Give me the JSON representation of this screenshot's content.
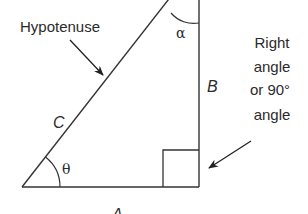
{
  "diagram": {
    "labels": {
      "hypotenuse": "Hypotenuse",
      "side_c": "C",
      "side_b": "B",
      "side_a": "A",
      "angle_theta": "θ",
      "angle_alpha": "α",
      "right_angle_line1": "Right",
      "right_angle_line2": "angle",
      "right_angle_line3": "or 90°",
      "right_angle_line4": "angle"
    },
    "colors": {
      "stroke": "#333333",
      "text": "#2b2b2b",
      "background": "#ffffff"
    }
  }
}
